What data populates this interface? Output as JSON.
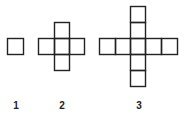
{
  "figures": [
    {
      "label": "1",
      "cells": 1
    },
    {
      "label": "2",
      "cells": 5
    },
    {
      "label": "3",
      "cells": 9
    }
  ],
  "stroke_color": "#222222"
}
